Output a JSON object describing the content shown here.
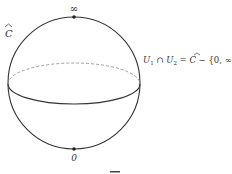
{
  "diagram": {
    "type": "riemann-sphere",
    "sphere_label": "C",
    "north_pole_label": "∞",
    "south_pole_label": "0",
    "annotation": {
      "u1": "U",
      "sub1": "1",
      "cap": " ∩ ",
      "u2": "U",
      "sub2": "2",
      "eq": " = ",
      "c": "C",
      "rest": " − {0, ∞}"
    },
    "colors": {
      "stroke": "#333333",
      "dashed": "#888888",
      "text": "#333333"
    }
  }
}
